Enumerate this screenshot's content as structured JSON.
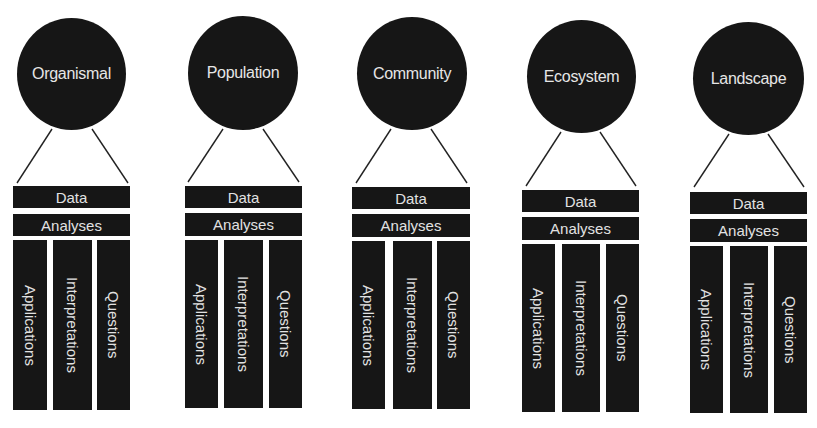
{
  "diagram": {
    "colors": {
      "fill": "#161616",
      "text": "#e2e2e2",
      "line": "#222222",
      "background": "#ffffff"
    },
    "groups": [
      {
        "title": "Organismal",
        "bars": [
          "Data",
          "Analyses"
        ],
        "columns": [
          "Applications",
          "Interpretations",
          "Questions"
        ]
      },
      {
        "title": "Population",
        "bars": [
          "Data",
          "Analyses"
        ],
        "columns": [
          "Applications",
          "Interpretations",
          "Questions"
        ]
      },
      {
        "title": "Community",
        "bars": [
          "Data",
          "Analyses"
        ],
        "columns": [
          "Applications",
          "Interpretations",
          "Questions"
        ]
      },
      {
        "title": "Ecosystem",
        "bars": [
          "Data",
          "Analyses"
        ],
        "columns": [
          "Applications",
          "Interpretations",
          "Questions"
        ]
      },
      {
        "title": "Landscape",
        "bars": [
          "Data",
          "Analyses"
        ],
        "columns": [
          "Applications",
          "Interpretations",
          "Questions"
        ]
      }
    ]
  }
}
